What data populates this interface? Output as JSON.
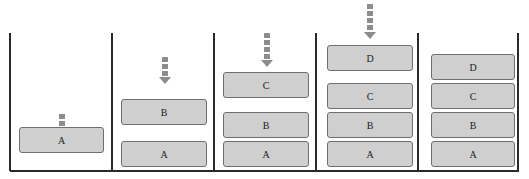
{
  "diagram": {
    "colors": {
      "box_fill": "#cfcfcf",
      "box_border": "#6e6e6e",
      "arrow": "#8c8c8c",
      "lines": "#2a2a2a"
    },
    "panels": [
      {
        "stack": [
          "A"
        ],
        "incoming_arrow": true
      },
      {
        "stack": [
          "A",
          "B"
        ],
        "incoming_arrow": true
      },
      {
        "stack": [
          "A",
          "B",
          "C"
        ],
        "incoming_arrow": true
      },
      {
        "stack": [
          "A",
          "B",
          "C",
          "D"
        ],
        "incoming_arrow": true
      },
      {
        "stack": [
          "A",
          "B",
          "C",
          "D"
        ],
        "incoming_arrow": false
      }
    ],
    "labels": {
      "p1_a": "A",
      "p2_a": "A",
      "p2_b": "B",
      "p3_a": "A",
      "p3_b": "B",
      "p3_c": "C",
      "p4_a": "A",
      "p4_b": "B",
      "p4_c": "C",
      "p4_d": "D",
      "p5_a": "A",
      "p5_b": "B",
      "p5_c": "C",
      "p5_d": "D"
    }
  }
}
